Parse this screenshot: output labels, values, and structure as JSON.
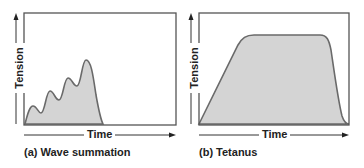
{
  "panels": [
    {
      "id": "a",
      "caption": "(a) Wave summation",
      "xlabel": "Time",
      "ylabel": "Tension"
    },
    {
      "id": "b",
      "caption": "(b) Tetanus",
      "xlabel": "Time",
      "ylabel": "Tension"
    }
  ],
  "colors": {
    "fill": "#d4d4d4",
    "stroke": "#666666",
    "frame": "#555555",
    "text": "#222222"
  }
}
